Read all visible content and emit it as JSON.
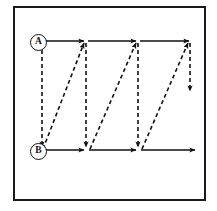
{
  "figure": {
    "kind": "diagram",
    "background": "#ffffff",
    "frame": {
      "stroke": "#1a1a1a",
      "stroke_width": 2,
      "x": 13,
      "y": 6,
      "width": 193,
      "height": 195
    }
  },
  "labels": {
    "top_node": "A",
    "bottom_node": "B"
  },
  "geometry": {
    "top_y": 41,
    "bottom_y": 150,
    "x_start": 42,
    "x_stops": [
      42,
      85,
      137,
      190
    ],
    "x_end": 196,
    "short_vertical_end_y": 93
  },
  "style": {
    "solid_stroke": "#111111",
    "dashed_stroke": "#111111",
    "solid_width": 1.6,
    "dashed_width": 1.6,
    "dash_pattern": "4,3",
    "arrow_fill": "#111111"
  },
  "elements": {
    "top_line_label": "upper traverse line A",
    "bottom_line_label": "lower traverse line B",
    "vertical_label": "vertical dashed descent",
    "diagonal_label": "diagonal dashed return",
    "arrow_label": "direction arrowhead"
  }
}
